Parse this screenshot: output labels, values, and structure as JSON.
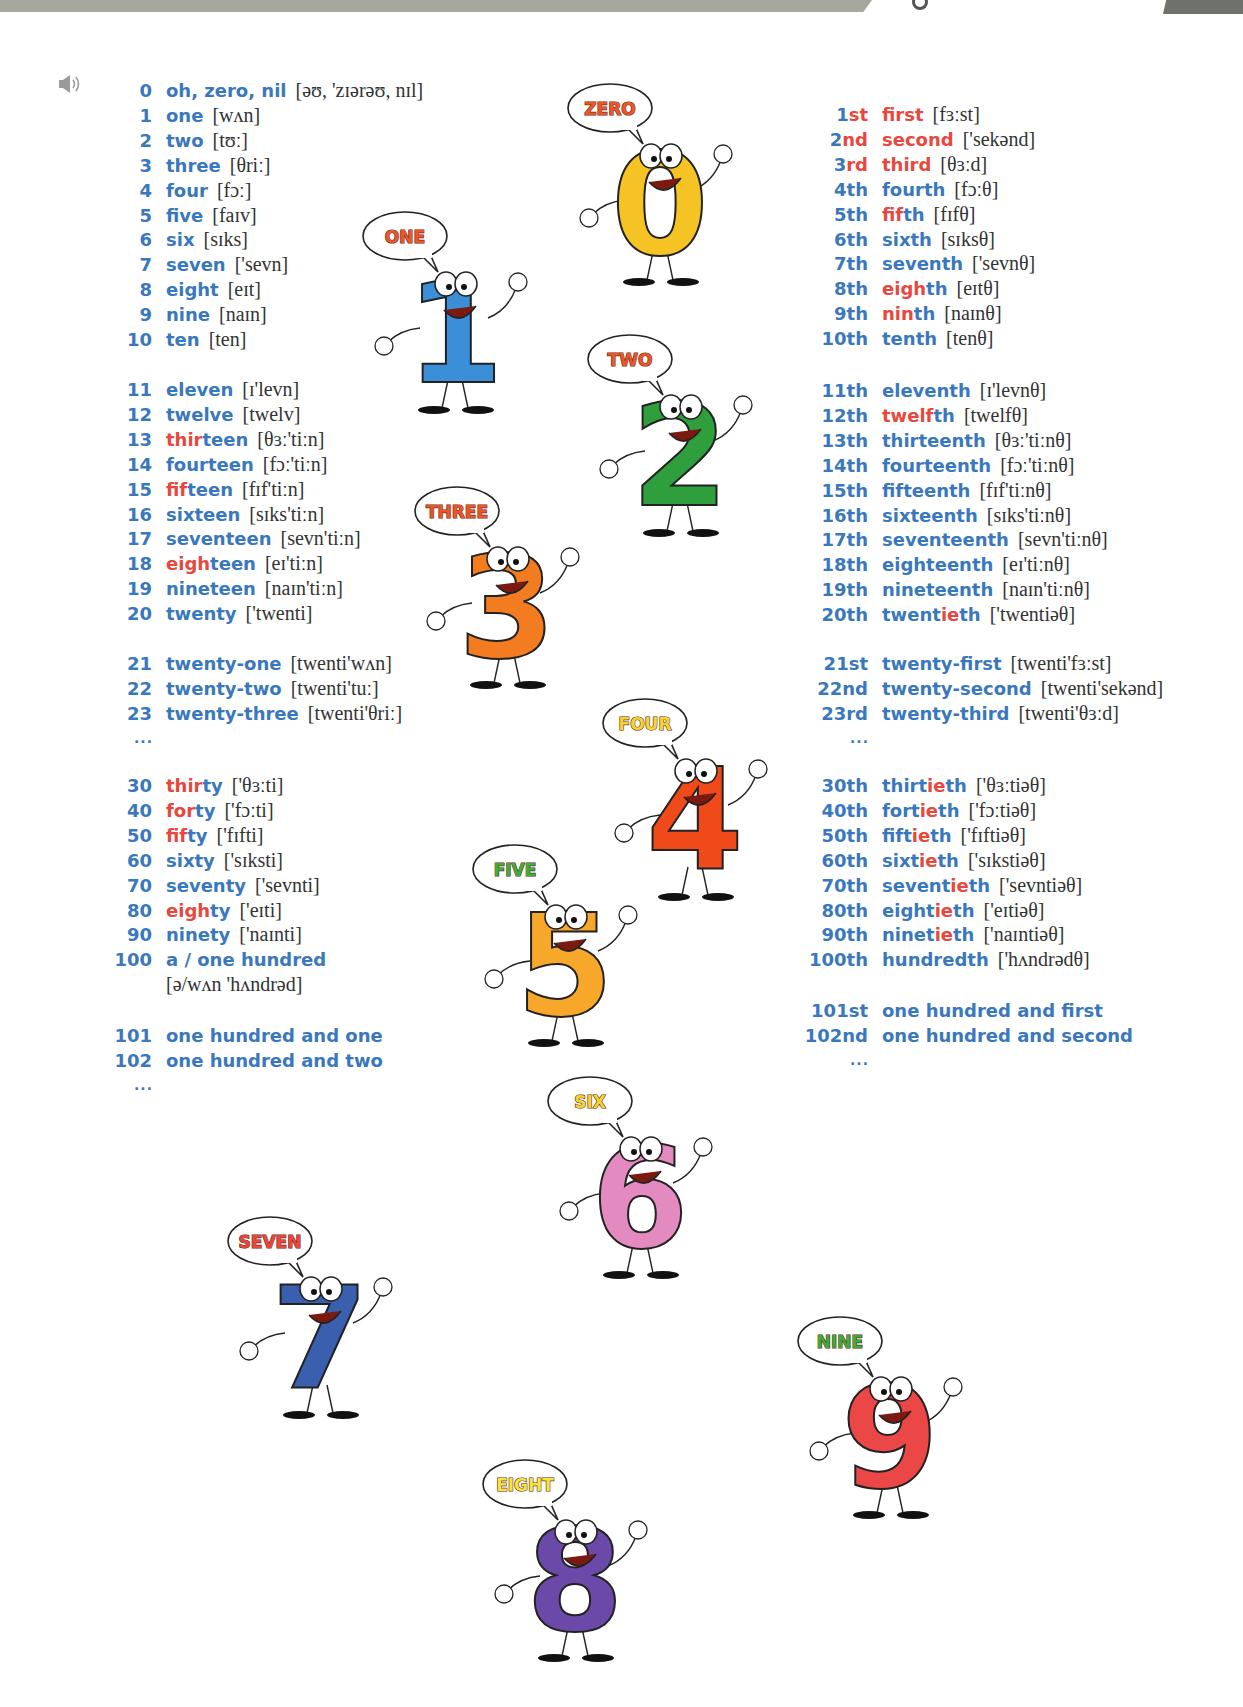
{
  "header": {
    "decor_left": "grey-banner",
    "decor_right": "dark-grey-tab"
  },
  "audio": {
    "icon": "speaker-icon"
  },
  "colors": {
    "number_blue": "#3a78bd",
    "highlight_red": "#e8473e",
    "ipa_text": "#333333"
  },
  "cardinals": {
    "groups": [
      {
        "rows": [
          {
            "n": "0",
            "pre": "",
            "hl": "",
            "post": "oh, zero, nil",
            "ipa": "[əʊ, 'zɪərəʊ, nɪl]"
          },
          {
            "n": "1",
            "pre": "",
            "hl": "",
            "post": "one",
            "ipa": "[wʌn]"
          },
          {
            "n": "2",
            "pre": "",
            "hl": "",
            "post": "two",
            "ipa": "[tʊː]"
          },
          {
            "n": "3",
            "pre": "",
            "hl": "",
            "post": "three",
            "ipa": "[θriː]"
          },
          {
            "n": "4",
            "pre": "",
            "hl": "",
            "post": "four",
            "ipa": "[fɔː]"
          },
          {
            "n": "5",
            "pre": "",
            "hl": "",
            "post": "five",
            "ipa": "[faɪv]"
          },
          {
            "n": "6",
            "pre": "",
            "hl": "",
            "post": "six",
            "ipa": "[sɪks]"
          },
          {
            "n": "7",
            "pre": "",
            "hl": "",
            "post": "seven",
            "ipa": "['sevn]"
          },
          {
            "n": "8",
            "pre": "",
            "hl": "",
            "post": "eight",
            "ipa": "[eɪt]"
          },
          {
            "n": "9",
            "pre": "",
            "hl": "",
            "post": "nine",
            "ipa": "[naɪn]"
          },
          {
            "n": "10",
            "pre": "",
            "hl": "",
            "post": "ten",
            "ipa": "[ten]"
          }
        ]
      },
      {
        "rows": [
          {
            "n": "11",
            "pre": "",
            "hl": "",
            "post": "eleven",
            "ipa": "[ɪ'levn]"
          },
          {
            "n": "12",
            "pre": "",
            "hl": "",
            "post": "twelve",
            "ipa": "[twelv]"
          },
          {
            "n": "13",
            "pre": "",
            "hl": "thir",
            "post": "teen",
            "ipa": "[θɜː'tiːn]"
          },
          {
            "n": "14",
            "pre": "",
            "hl": "",
            "post": "fourteen",
            "ipa": "[fɔː'tiːn]"
          },
          {
            "n": "15",
            "pre": "",
            "hl": "fif",
            "post": "teen",
            "ipa": "[fɪf'tiːn]"
          },
          {
            "n": "16",
            "pre": "",
            "hl": "",
            "post": "sixteen",
            "ipa": "[sɪks'tiːn]"
          },
          {
            "n": "17",
            "pre": "",
            "hl": "",
            "post": "seventeen",
            "ipa": "[sevn'tiːn]"
          },
          {
            "n": "18",
            "pre": "",
            "hl": "eigh",
            "post": "teen",
            "ipa": "[eɪ'tiːn]"
          },
          {
            "n": "19",
            "pre": "",
            "hl": "",
            "post": "nineteen",
            "ipa": "[naɪn'tiːn]"
          },
          {
            "n": "20",
            "pre": "",
            "hl": "",
            "post": "twenty",
            "ipa": "['twenti]"
          }
        ]
      },
      {
        "rows": [
          {
            "n": "21",
            "pre": "",
            "hl": "",
            "post": "twenty-one",
            "ipa": "[twenti'wʌn]"
          },
          {
            "n": "22",
            "pre": "",
            "hl": "",
            "post": "twenty-two",
            "ipa": "[twenti'tuː]"
          },
          {
            "n": "23",
            "pre": "",
            "hl": "",
            "post": "twenty-three",
            "ipa": "[twenti'θriː]"
          }
        ],
        "ellipsis": "..."
      },
      {
        "rows": [
          {
            "n": "30",
            "pre": "",
            "hl": "thir",
            "post": "ty",
            "ipa": "['θɜːti]"
          },
          {
            "n": "40",
            "pre": "",
            "hl": "for",
            "post": "ty",
            "ipa": "['fɔːti]"
          },
          {
            "n": "50",
            "pre": "",
            "hl": "fif",
            "post": "ty",
            "ipa": "['fɪfti]"
          },
          {
            "n": "60",
            "pre": "",
            "hl": "",
            "post": "sixty",
            "ipa": "['sɪksti]"
          },
          {
            "n": "70",
            "pre": "",
            "hl": "",
            "post": "seventy",
            "ipa": "['sevnti]"
          },
          {
            "n": "80",
            "pre": "",
            "hl": "eigh",
            "post": "ty",
            "ipa": "['eɪti]"
          },
          {
            "n": "90",
            "pre": "",
            "hl": "",
            "post": "ninety",
            "ipa": "['naɪnti]"
          },
          {
            "n": "100",
            "pre": "",
            "hl": "",
            "post": "a / one hundred",
            "ipa": ""
          }
        ],
        "continuation_ipa": "[ə/wʌn 'hʌndrəd]"
      },
      {
        "rows": [
          {
            "n": "101",
            "pre": "",
            "hl": "",
            "post": "one hundred and one",
            "ipa": ""
          },
          {
            "n": "102",
            "pre": "",
            "hl": "",
            "post": "one hundred and two",
            "ipa": ""
          }
        ],
        "ellipsis": "..."
      }
    ]
  },
  "ordinals": {
    "groups": [
      {
        "rows": [
          {
            "nb": "1",
            "ns": "st",
            "nsRed": true,
            "pre": "",
            "hl": "first",
            "post": "",
            "ipa": "[fɜːst]"
          },
          {
            "nb": "2",
            "ns": "nd",
            "nsRed": true,
            "pre": "",
            "hl": "second",
            "post": "",
            "ipa": "['sekənd]"
          },
          {
            "nb": "3",
            "ns": "rd",
            "nsRed": true,
            "pre": "",
            "hl": "third",
            "post": "",
            "ipa": "[θɜːd]"
          },
          {
            "nb": "4",
            "ns": "th",
            "nsRed": false,
            "pre": "fourth",
            "hl": "",
            "post": "",
            "ipa": "[fɔːθ]"
          },
          {
            "nb": "5",
            "ns": "th",
            "nsRed": false,
            "pre": "",
            "hl": "fif",
            "post": "th",
            "ipa": "[fɪfθ]"
          },
          {
            "nb": "6",
            "ns": "th",
            "nsRed": false,
            "pre": "sixth",
            "hl": "",
            "post": "",
            "ipa": "[sɪksθ]"
          },
          {
            "nb": "7",
            "ns": "th",
            "nsRed": false,
            "pre": "seventh",
            "hl": "",
            "post": "",
            "ipa": "['sevnθ]"
          },
          {
            "nb": "8",
            "ns": "th",
            "nsRed": false,
            "pre": "",
            "hl": "eigh",
            "post": "th",
            "ipa": "[eɪtθ]"
          },
          {
            "nb": "9",
            "ns": "th",
            "nsRed": false,
            "pre": "",
            "hl": "nin",
            "post": "th",
            "ipa": "[naɪnθ]"
          },
          {
            "nb": "10",
            "ns": "th",
            "nsRed": false,
            "pre": "tenth",
            "hl": "",
            "post": "",
            "ipa": "[tenθ]"
          }
        ]
      },
      {
        "rows": [
          {
            "nb": "11",
            "ns": "th",
            "nsRed": false,
            "pre": "eleventh",
            "hl": "",
            "post": "",
            "ipa": "[ɪ'levnθ]"
          },
          {
            "nb": "12",
            "ns": "th",
            "nsRed": false,
            "pre": "",
            "hl": "twelf",
            "post": "th",
            "ipa": "[twelfθ]"
          },
          {
            "nb": "13",
            "ns": "th",
            "nsRed": false,
            "pre": "thirteenth",
            "hl": "",
            "post": "",
            "ipa": "[θɜː'tiːnθ]"
          },
          {
            "nb": "14",
            "ns": "th",
            "nsRed": false,
            "pre": "fourteenth",
            "hl": "",
            "post": "",
            "ipa": "[fɔː'tiːnθ]"
          },
          {
            "nb": "15",
            "ns": "th",
            "nsRed": false,
            "pre": "fifteenth",
            "hl": "",
            "post": "",
            "ipa": "[fɪf'tiːnθ]"
          },
          {
            "nb": "16",
            "ns": "th",
            "nsRed": false,
            "pre": "sixteenth",
            "hl": "",
            "post": "",
            "ipa": "[sɪks'tiːnθ]"
          },
          {
            "nb": "17",
            "ns": "th",
            "nsRed": false,
            "pre": "seventeenth",
            "hl": "",
            "post": "",
            "ipa": "[sevn'tiːnθ]"
          },
          {
            "nb": "18",
            "ns": "th",
            "nsRed": false,
            "pre": "eighteenth",
            "hl": "",
            "post": "",
            "ipa": "[eɪ'tiːnθ]"
          },
          {
            "nb": "19",
            "ns": "th",
            "nsRed": false,
            "pre": "nineteenth",
            "hl": "",
            "post": "",
            "ipa": "[naɪn'tiːnθ]"
          },
          {
            "nb": "20",
            "ns": "th",
            "nsRed": false,
            "pre": "twent",
            "hl": "ie",
            "post": "th",
            "ipa": "['twentiəθ]"
          }
        ]
      },
      {
        "rows": [
          {
            "nb": "21",
            "ns": "st",
            "nsRed": false,
            "pre": "twenty-first",
            "hl": "",
            "post": "",
            "ipa": "[twenti'fɜːst]"
          },
          {
            "nb": "22",
            "ns": "nd",
            "nsRed": false,
            "pre": "twenty-second",
            "hl": "",
            "post": "",
            "ipa": "[twenti'sekənd]"
          },
          {
            "nb": "23",
            "ns": "rd",
            "nsRed": false,
            "pre": "twenty-third",
            "hl": "",
            "post": "",
            "ipa": "[twenti'θɜːd]"
          }
        ],
        "ellipsis": "..."
      },
      {
        "rows": [
          {
            "nb": "30",
            "ns": "th",
            "nsRed": false,
            "pre": "thirt",
            "hl": "ie",
            "post": "th",
            "ipa": "['θɜːtiəθ]"
          },
          {
            "nb": "40",
            "ns": "th",
            "nsRed": false,
            "pre": "fort",
            "hl": "ie",
            "post": "th",
            "ipa": "['fɔːtiəθ]"
          },
          {
            "nb": "50",
            "ns": "th",
            "nsRed": false,
            "pre": "fift",
            "hl": "ie",
            "post": "th",
            "ipa": "['fɪftiəθ]"
          },
          {
            "nb": "60",
            "ns": "th",
            "nsRed": false,
            "pre": "sixt",
            "hl": "ie",
            "post": "th",
            "ipa": "['sɪkstiəθ]"
          },
          {
            "nb": "70",
            "ns": "th",
            "nsRed": false,
            "pre": "sevent",
            "hl": "ie",
            "post": "th",
            "ipa": "['sevntiəθ]"
          },
          {
            "nb": "80",
            "ns": "th",
            "nsRed": false,
            "pre": "eight",
            "hl": "ie",
            "post": "th",
            "ipa": "['eɪtiəθ]"
          },
          {
            "nb": "90",
            "ns": "th",
            "nsRed": false,
            "pre": "ninet",
            "hl": "ie",
            "post": "th",
            "ipa": "['naɪntiəθ]"
          },
          {
            "nb": "100",
            "ns": "th",
            "nsRed": false,
            "pre": "hundredth",
            "hl": "",
            "post": "",
            "ipa": "['hʌndrədθ]"
          }
        ]
      },
      {
        "rows": [
          {
            "nb": "101",
            "ns": "st",
            "nsRed": false,
            "pre": "one hundred and first",
            "hl": "",
            "post": "",
            "ipa": ""
          },
          {
            "nb": "102",
            "ns": "nd",
            "nsRed": false,
            "pre": "one hundred and second",
            "hl": "",
            "post": "",
            "ipa": ""
          }
        ],
        "ellipsis": "..."
      }
    ]
  },
  "characters": [
    {
      "label": "ZERO",
      "digit": "0",
      "body": "#f6c325",
      "text": "#e8562a",
      "x": 565,
      "y": 82
    },
    {
      "label": "ONE",
      "digit": "1",
      "body": "#3b8fd8",
      "text": "#e8562a",
      "x": 360,
      "y": 210
    },
    {
      "label": "TWO",
      "digit": "2",
      "body": "#2f9e3c",
      "text": "#e8562a",
      "x": 585,
      "y": 333
    },
    {
      "label": "THREE",
      "digit": "3",
      "body": "#f27c1f",
      "text": "#e8562a",
      "x": 412,
      "y": 485
    },
    {
      "label": "FOUR",
      "digit": "4",
      "body": "#f04a1b",
      "text": "#f5d532",
      "x": 600,
      "y": 697
    },
    {
      "label": "FIVE",
      "digit": "5",
      "body": "#f7a72a",
      "text": "#3cae3a",
      "x": 470,
      "y": 843
    },
    {
      "label": "SIX",
      "digit": "6",
      "body": "#e38bc0",
      "text": "#f5d532",
      "x": 545,
      "y": 1075
    },
    {
      "label": "SEVEN",
      "digit": "7",
      "body": "#3a5fae",
      "text": "#e8473e",
      "x": 225,
      "y": 1215
    },
    {
      "label": "EIGHT",
      "digit": "8",
      "body": "#6b49a8",
      "text": "#f5e342",
      "x": 480,
      "y": 1458
    },
    {
      "label": "NINE",
      "digit": "9",
      "body": "#ec4747",
      "text": "#3aaa3a",
      "x": 795,
      "y": 1315
    }
  ]
}
